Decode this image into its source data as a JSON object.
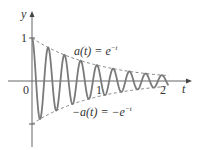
{
  "chart_data": {
    "type": "line",
    "title": "",
    "xlabel": "t",
    "ylabel": "y",
    "x_ticks": [
      "0",
      "1",
      "2"
    ],
    "y_ticks": [
      "1"
    ],
    "xlim": [
      -0.4,
      2.35
    ],
    "ylim": [
      -1.5,
      1.2
    ],
    "series": [
      {
        "name": "e^{-t} cos(8πt)",
        "style": "solid",
        "function": "exp(-t)*cos(8*pi*t)",
        "t_range": [
          0,
          2.1
        ]
      },
      {
        "name": "a(t) = e^{-t}",
        "style": "dashed",
        "function": "exp(-t)",
        "t_range": [
          0,
          2.1
        ]
      },
      {
        "name": "-a(t) = -e^{-t}",
        "style": "dashed",
        "function": "-exp(-t)",
        "t_range": [
          0,
          2.1
        ]
      }
    ],
    "annotations": [
      "a(t) = e^{-t}",
      "-a(t) = -e^{-t}"
    ]
  },
  "labels": {
    "y_axis": "y",
    "x_axis": "t",
    "origin": "0",
    "tick_one_y": "1",
    "tick_one_x": "1",
    "tick_two_x": "2",
    "upper_envelope": "a(t) = e",
    "upper_exp": "−t",
    "lower_envelope": "−a(t) = −e",
    "lower_exp": "−t"
  },
  "colors": {
    "curve": "#7a7a7a",
    "axis": "#555555",
    "envelope": "#666666"
  }
}
